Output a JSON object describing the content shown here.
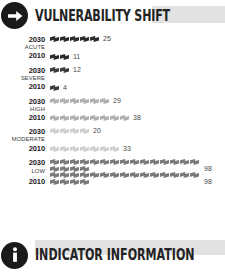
{
  "header": {
    "icon": "arrow-right-circle-icon",
    "title": "VULNERABILITY SHIFT"
  },
  "footer": {
    "icon": "info-circle-icon",
    "title": "INDICATOR INFORMATION"
  },
  "chart_data": {
    "type": "bar",
    "title": "VULNERABILITY SHIFT",
    "subtitle": "",
    "xlabel": "",
    "ylabel": "",
    "unit_per_icon": 5,
    "categories": [
      "ACUTE",
      "SEVERE",
      "HIGH",
      "MODERATE",
      "LOW"
    ],
    "series": [
      {
        "name": "2030",
        "values": [
          25,
          12,
          29,
          20,
          98
        ]
      },
      {
        "name": "2010",
        "values": [
          11,
          4,
          38,
          33,
          98
        ]
      }
    ],
    "legend_position": "inline-left",
    "grid": false
  },
  "tiers": [
    {
      "name": "ACUTE",
      "color": "#2b2b2b",
      "rows": [
        {
          "year": "2030",
          "value": "25",
          "icons": 5
        },
        {
          "year": "2010",
          "value": "11",
          "icons": 2
        }
      ]
    },
    {
      "name": "SEVERE",
      "color": "#3c3c3c",
      "rows": [
        {
          "year": "2030",
          "value": "12",
          "icons": 2
        },
        {
          "year": "2010",
          "value": "4",
          "icons": 1
        }
      ]
    },
    {
      "name": "HIGH",
      "color": "#b0b0b0",
      "rows": [
        {
          "year": "2030",
          "value": "29",
          "icons": 6
        },
        {
          "year": "2010",
          "value": "38",
          "icons": 8
        }
      ]
    },
    {
      "name": "MODERATE",
      "color": "#cfcfcf",
      "rows": [
        {
          "year": "2030",
          "value": "20",
          "icons": 4
        },
        {
          "year": "2010",
          "value": "33",
          "icons": 7
        }
      ]
    },
    {
      "name": "LOW",
      "color": "#7a7a7a",
      "rows": [
        {
          "year": "2030",
          "value": "98",
          "icons": 19
        },
        {
          "year": "2010",
          "value": "98",
          "icons": 19
        }
      ]
    }
  ]
}
